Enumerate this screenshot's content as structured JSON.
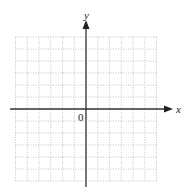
{
  "diagram": {
    "type": "coordinate-grid",
    "x_axis_label": "x",
    "y_axis_label": "y",
    "origin_label": "0",
    "grid": {
      "cells_left": 6,
      "cells_right": 6,
      "cells_up": 6,
      "cells_down": 6
    },
    "colors": {
      "axis": "#333333",
      "grid": "#b5b5b5",
      "label": "#222222"
    }
  }
}
